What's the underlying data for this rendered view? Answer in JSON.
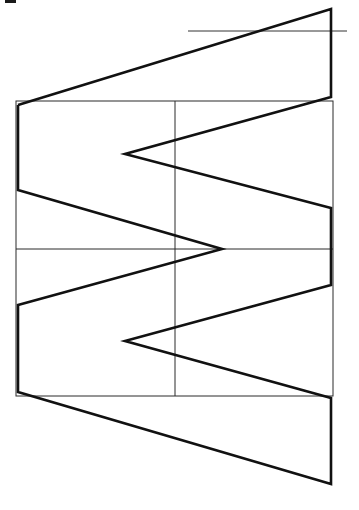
{
  "diagram": {
    "type": "geometric-line-drawing",
    "colors": {
      "background": "#ffffff",
      "line": "#111111"
    },
    "elements": {
      "outline": "thick zigzag/trapezoid outline",
      "grid_rectangle": "thin rectangle",
      "vertical_center_line": "thin vertical divider",
      "horizontal_center_line": "thin horizontal divider",
      "reference_line": "thin horizontal reference line at top right",
      "corner_mark": "small dark mark at top-left corner"
    }
  }
}
